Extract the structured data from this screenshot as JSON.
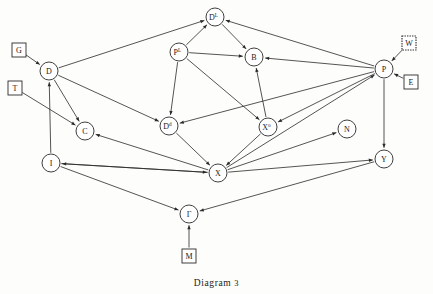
{
  "figure": {
    "caption_text": "Diagram",
    "caption_number": "3",
    "background_color": "#fdfdfb",
    "ink_color": "#2a2a2a"
  },
  "chart_data": {
    "type": "diagram",
    "nodes": [
      {
        "id": "DL",
        "label": "D",
        "superscript": "L",
        "shape": "circle",
        "x": 215,
        "y": 17,
        "r": 9
      },
      {
        "id": "PL",
        "label": "P",
        "superscript": "L",
        "shape": "circle",
        "x": 179,
        "y": 52,
        "r": 9
      },
      {
        "id": "B",
        "label": "B",
        "superscript": "",
        "shape": "circle",
        "x": 254,
        "y": 57,
        "r": 9
      },
      {
        "id": "D",
        "label": "D",
        "superscript": "",
        "shape": "circle",
        "x": 49,
        "y": 71,
        "r": 9
      },
      {
        "id": "P",
        "label": "P",
        "superscript": "",
        "shape": "circle",
        "x": 384,
        "y": 69,
        "r": 9
      },
      {
        "id": "C",
        "label": "C",
        "superscript": "",
        "shape": "circle",
        "x": 85,
        "y": 131,
        "r": 9
      },
      {
        "id": "Dd",
        "label": "D",
        "superscript": "d",
        "shape": "circle",
        "x": 169,
        "y": 126,
        "r": 9
      },
      {
        "id": "Xo",
        "label": "X",
        "superscript": "o",
        "shape": "circle",
        "x": 268,
        "y": 127,
        "r": 9
      },
      {
        "id": "N",
        "label": "N",
        "superscript": "",
        "shape": "circle",
        "x": 347,
        "y": 129,
        "r": 9
      },
      {
        "id": "I",
        "label": "I",
        "superscript": "",
        "shape": "circle",
        "x": 51,
        "y": 163,
        "r": 9
      },
      {
        "id": "X",
        "label": "X",
        "superscript": "",
        "shape": "circle",
        "x": 218,
        "y": 173,
        "r": 9
      },
      {
        "id": "Y",
        "label": "Y",
        "superscript": "",
        "shape": "circle",
        "x": 384,
        "y": 159,
        "r": 9
      },
      {
        "id": "Gamma",
        "label": "Γ",
        "superscript": "",
        "shape": "circle",
        "x": 189,
        "y": 214,
        "r": 9
      }
    ],
    "boxes": [
      {
        "id": "G",
        "label": "G",
        "shape": "square",
        "border": "solid",
        "x": 19,
        "y": 50,
        "size": 14
      },
      {
        "id": "T",
        "label": "T",
        "shape": "square",
        "border": "solid",
        "x": 15,
        "y": 88,
        "size": 14
      },
      {
        "id": "W",
        "label": "W",
        "shape": "square",
        "border": "dotted",
        "x": 409,
        "y": 43,
        "size": 14
      },
      {
        "id": "E",
        "label": "E",
        "shape": "square",
        "border": "solid",
        "x": 411,
        "y": 82,
        "size": 14
      },
      {
        "id": "M",
        "label": "M",
        "shape": "square",
        "border": "solid",
        "x": 189,
        "y": 256,
        "size": 14
      }
    ],
    "edges": [
      {
        "from": "G",
        "to": "D",
        "arrow": "to"
      },
      {
        "from": "D",
        "to": "DL",
        "arrow": "to"
      },
      {
        "from": "PL",
        "to": "DL",
        "arrow": "to"
      },
      {
        "from": "P",
        "to": "DL",
        "arrow": "to"
      },
      {
        "from": "DL",
        "to": "B",
        "arrow": "to"
      },
      {
        "from": "PL",
        "to": "B",
        "arrow": "to"
      },
      {
        "from": "P",
        "to": "B",
        "arrow": "to"
      },
      {
        "from": "Xo",
        "to": "B",
        "arrow": "to"
      },
      {
        "from": "W",
        "to": "P",
        "arrow": "to"
      },
      {
        "from": "E",
        "to": "P",
        "arrow": "to"
      },
      {
        "from": "D",
        "to": "C",
        "arrow": "to"
      },
      {
        "from": "I",
        "to": "D",
        "arrow": "to"
      },
      {
        "from": "T",
        "to": "C",
        "arrow": "to"
      },
      {
        "from": "X",
        "to": "C",
        "arrow": "to"
      },
      {
        "from": "D",
        "to": "Dd",
        "arrow": "to"
      },
      {
        "from": "PL",
        "to": "Dd",
        "arrow": "to"
      },
      {
        "from": "P",
        "to": "Dd",
        "arrow": "to"
      },
      {
        "from": "PL",
        "to": "Xo",
        "arrow": "to"
      },
      {
        "from": "P",
        "to": "Xo",
        "arrow": "to"
      },
      {
        "from": "Dd",
        "to": "X",
        "arrow": "to"
      },
      {
        "from": "Xo",
        "to": "X",
        "arrow": "to"
      },
      {
        "from": "I",
        "to": "X",
        "arrow": "to"
      },
      {
        "from": "X",
        "to": "I",
        "arrow": "to"
      },
      {
        "from": "X",
        "to": "P",
        "arrow": "to"
      },
      {
        "from": "X",
        "to": "N",
        "arrow": "to"
      },
      {
        "from": "X",
        "to": "Y",
        "arrow": "to"
      },
      {
        "from": "P",
        "to": "Y",
        "arrow": "to"
      },
      {
        "from": "I",
        "to": "Gamma",
        "arrow": "to"
      },
      {
        "from": "Y",
        "to": "Gamma",
        "arrow": "to"
      },
      {
        "from": "M",
        "to": "Gamma",
        "arrow": "to"
      }
    ]
  }
}
